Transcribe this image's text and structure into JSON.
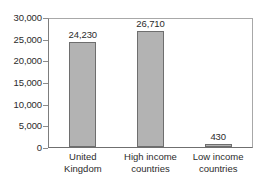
{
  "chart_data": {
    "type": "bar",
    "title": "",
    "xlabel": "",
    "ylabel": "",
    "categories": [
      "United Kingdom",
      "High income countries",
      "Low income countries"
    ],
    "category_lines": [
      [
        "United",
        "Kingdom"
      ],
      [
        "High income",
        "countries"
      ],
      [
        "Low income",
        "countries"
      ]
    ],
    "values": [
      24230,
      26710,
      430
    ],
    "value_labels": [
      "24,230",
      "26,710",
      "430"
    ],
    "ylim": [
      0,
      30000
    ],
    "ytick_values": [
      0,
      5000,
      10000,
      15000,
      20000,
      25000,
      30000
    ],
    "ytick_labels": [
      "0",
      "5,000",
      "10,000",
      "15,000",
      "20,000",
      "25,000",
      "30,000"
    ],
    "grid": false,
    "legend": null,
    "bar_color": "#b3b3b3",
    "bar_edge_color": "#6e6e6e",
    "frame_color": "#a8a8a8",
    "axis_color": "#6f6f6f",
    "background": "#ffffff"
  }
}
